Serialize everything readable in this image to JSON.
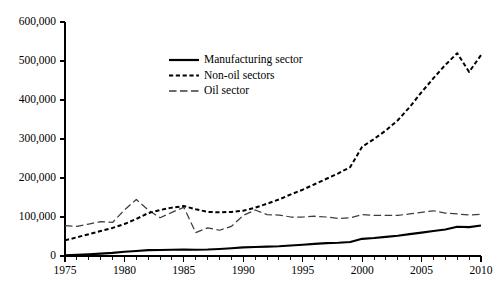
{
  "chart_data": {
    "type": "line",
    "title": "",
    "subtitle": "",
    "xlabel": "",
    "ylabel": "",
    "xlim": [
      1975,
      2010
    ],
    "ylim": [
      0,
      600000
    ],
    "grid": false,
    "legend_position": "upper-center-left",
    "x": [
      1975,
      1976,
      1977,
      1978,
      1979,
      1980,
      1981,
      1982,
      1983,
      1984,
      1985,
      1986,
      1987,
      1988,
      1989,
      1990,
      1991,
      1992,
      1993,
      1994,
      1995,
      1996,
      1997,
      1998,
      1999,
      2000,
      2001,
      2002,
      2003,
      2004,
      2005,
      2006,
      2007,
      2008,
      2009,
      2010
    ],
    "x_tick_labels": [
      "1975",
      "1980",
      "1985",
      "1990",
      "1995",
      "2000",
      "2005",
      "2010"
    ],
    "x_tick_values": [
      1975,
      1980,
      1985,
      1990,
      1995,
      2000,
      2005,
      2010
    ],
    "x_minor_tick_interval": 1,
    "y_tick_labels": [
      "0",
      "100,000",
      "200,000",
      "300,000",
      "400,000",
      "500,000",
      "600,000"
    ],
    "y_tick_values": [
      0,
      100000,
      200000,
      300000,
      400000,
      500000,
      600000
    ],
    "series": [
      {
        "name": "Manufacturing sector",
        "style": "solid",
        "color": "#000000",
        "values": [
          2000,
          3000,
          4500,
          6000,
          8000,
          11000,
          13000,
          15000,
          15500,
          16000,
          16500,
          16000,
          16500,
          18000,
          20000,
          22000,
          23000,
          24000,
          25000,
          27000,
          29000,
          31000,
          33000,
          34000,
          36000,
          44000,
          46000,
          49000,
          52000,
          56000,
          60000,
          64000,
          68000,
          75000,
          74000,
          78000
        ]
      },
      {
        "name": "Non-oil sectors",
        "style": "dotted",
        "color": "#000000",
        "values": [
          40000,
          48000,
          56000,
          64000,
          72000,
          82000,
          95000,
          110000,
          118000,
          124000,
          128000,
          120000,
          113000,
          112000,
          113000,
          116000,
          124000,
          134000,
          145000,
          158000,
          170000,
          184000,
          198000,
          212000,
          228000,
          280000,
          300000,
          322000,
          348000,
          382000,
          420000,
          456000,
          490000,
          520000,
          472000,
          515000
        ]
      },
      {
        "name": "Oil sector",
        "style": "dashed",
        "color": "#3d3d3d",
        "values": [
          78000,
          76000,
          82000,
          88000,
          86000,
          118000,
          145000,
          118000,
          98000,
          112000,
          125000,
          60000,
          72000,
          66000,
          76000,
          104000,
          118000,
          106000,
          105000,
          100000,
          100000,
          102000,
          100000,
          96000,
          98000,
          106000,
          104000,
          104000,
          104000,
          108000,
          112000,
          116000,
          110000,
          108000,
          105000,
          107000
        ]
      }
    ],
    "legend": [
      {
        "label": "Manufacturing sector",
        "style": "solid"
      },
      {
        "label": "Non-oil sectors",
        "style": "dotted"
      },
      {
        "label": "Oil sector",
        "style": "dashed"
      }
    ]
  },
  "colors": {
    "background": "#ffffff",
    "axis": "#000000",
    "manufacturing": "#000000",
    "nonoil": "#000000",
    "oil": "#3d3d3d"
  }
}
